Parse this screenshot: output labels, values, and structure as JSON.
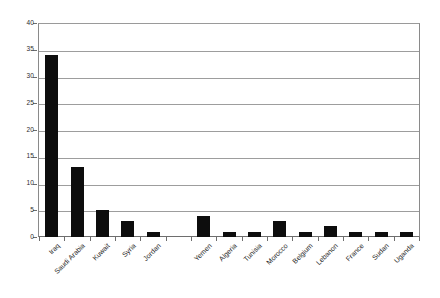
{
  "chart_data": {
    "type": "bar",
    "title": "",
    "subtitle": "",
    "xlabel": "",
    "ylabel": "",
    "ylim": [
      0,
      40
    ],
    "ytick_step": 5,
    "grid": true,
    "legend": false,
    "legend_position": "none",
    "bar_color": "#0d0d0d",
    "categories": [
      "Iraq",
      "Saudi Arabia",
      "Kuwait",
      "Syria",
      "Jordan",
      "",
      "Yemen",
      "Algeria",
      "Tunisia",
      "Morocco",
      "Belgium",
      "Lebanon",
      "France",
      "Sudan",
      "Uganda"
    ],
    "values": [
      34,
      13,
      5,
      3,
      1,
      0,
      4,
      1,
      1,
      3,
      1,
      2,
      1,
      1,
      1
    ],
    "ytick_labels": [
      "0",
      "5",
      "10",
      "15",
      "20",
      "25",
      "30",
      "35",
      "40"
    ],
    "ytick_values": [
      0,
      5,
      10,
      15,
      20,
      25,
      30,
      35,
      40
    ]
  },
  "colors": {
    "bar": "#0d0d0d",
    "grid": "#9d9d9d",
    "axis": "#6e6e6e",
    "background": "#ffffff",
    "text": "#1e1e1e"
  }
}
